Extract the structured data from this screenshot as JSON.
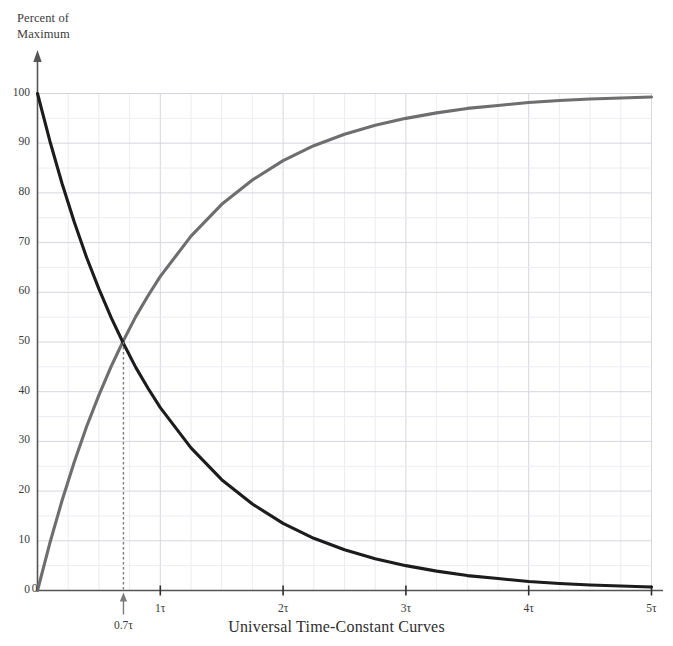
{
  "figure": {
    "y_axis_title": "Percent of\nMaximum",
    "chart_title": "Universal Time-Constant Curves"
  },
  "chart_data": {
    "type": "line",
    "title": "Universal Time-Constant Curves",
    "xlabel": "",
    "ylabel": "Percent of Maximum",
    "xlim": [
      0,
      5
    ],
    "ylim": [
      0,
      100
    ],
    "grid": true,
    "legend": "none",
    "x_tick_labels": [
      "0",
      "1τ",
      "2τ",
      "3τ",
      "4τ",
      "5τ"
    ],
    "x_tick_values": [
      0,
      1,
      2,
      3,
      4,
      5
    ],
    "y_tick_labels": [
      "0",
      "10",
      "20",
      "30",
      "40",
      "50",
      "60",
      "70",
      "80",
      "90",
      "100"
    ],
    "y_tick_values": [
      0,
      10,
      20,
      30,
      40,
      50,
      60,
      70,
      80,
      90,
      100
    ],
    "x_minor_step": 0.25,
    "y_minor_step": 5,
    "annotations": [
      {
        "label": "0.7τ",
        "x": 0.7,
        "y": 50,
        "type": "vertical-dashed-line-with-arrow",
        "color": "#7a7a7a"
      }
    ],
    "series": [
      {
        "name": "rising",
        "formula": "100 * (1 - exp(-t))",
        "color": "#6e6e6e",
        "x": [
          0,
          0.1,
          0.2,
          0.3,
          0.4,
          0.5,
          0.6,
          0.7,
          0.8,
          0.9,
          1,
          1.25,
          1.5,
          1.75,
          2,
          2.25,
          2.5,
          2.75,
          3,
          3.25,
          3.5,
          3.75,
          4,
          4.25,
          4.5,
          4.75,
          5
        ],
        "values": [
          0,
          9.5,
          18.1,
          25.9,
          33,
          39.3,
          45.1,
          50.3,
          55.1,
          59.3,
          63.2,
          71.3,
          77.7,
          82.6,
          86.5,
          89.5,
          91.8,
          93.6,
          95,
          96.1,
          97,
          97.6,
          98.2,
          98.6,
          98.9,
          99.1,
          99.3
        ]
      },
      {
        "name": "falling",
        "formula": "100 * exp(-t)",
        "color": "#1c1c1c",
        "x": [
          0,
          0.1,
          0.2,
          0.3,
          0.4,
          0.5,
          0.6,
          0.7,
          0.8,
          0.9,
          1,
          1.25,
          1.5,
          1.75,
          2,
          2.25,
          2.5,
          2.75,
          3,
          3.25,
          3.5,
          3.75,
          4,
          4.25,
          4.5,
          4.75,
          5
        ],
        "values": [
          100,
          90.5,
          81.9,
          74.1,
          67,
          60.7,
          54.9,
          49.7,
          44.9,
          40.7,
          36.8,
          28.7,
          22.3,
          17.4,
          13.5,
          10.5,
          8.2,
          6.4,
          5,
          3.9,
          3,
          2.4,
          1.8,
          1.4,
          1.1,
          0.9,
          0.7
        ]
      }
    ]
  },
  "colors": {
    "rising_curve": "#6e6e6e",
    "falling_curve": "#1c1c1c",
    "grid_minor": "#ececf2",
    "grid_major": "#d6d6de",
    "axis": "#555555",
    "annotation": "#7a7a7a"
  }
}
